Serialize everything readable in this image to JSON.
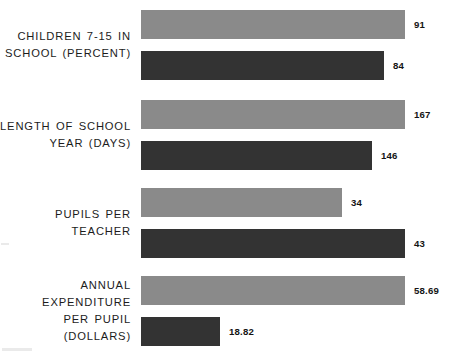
{
  "chart_data": {
    "type": "bar",
    "orientation": "horizontal",
    "title": "",
    "subtitle": "",
    "xlabel": "",
    "ylabel": "",
    "grid": false,
    "axis_visible": false,
    "legend_position": "none",
    "scaling": "per-category (each row's larger value spans the full plot width)",
    "categories": [
      "CHILDREN 7-15 IN\nSCHOOL (PERCENT)",
      "LENGTH OF SCHOOL\nYEAR (DAYS)",
      "PUPILS PER\nTEACHER",
      "ANNUAL EXPENDITURE\nPER PUPIL (DOLLARS)"
    ],
    "series": [
      {
        "name": "series-a",
        "color": "#8a8a8a",
        "values": [
          91,
          167,
          34,
          58.69
        ],
        "value_labels": [
          "91",
          "167",
          "34",
          "58.69"
        ],
        "bar_widths_px": [
          264,
          264,
          201,
          264
        ]
      },
      {
        "name": "series-b",
        "color": "#333333",
        "values": [
          84,
          146,
          43,
          18.82
        ],
        "value_labels": [
          "84",
          "146",
          "43",
          "18.82"
        ],
        "bar_widths_px": [
          243,
          231,
          264,
          79
        ]
      }
    ],
    "colors": {
      "series_a": "#8a8a8a",
      "series_b": "#333333",
      "background": "#ffffff",
      "text": "#1c1c1c"
    }
  }
}
